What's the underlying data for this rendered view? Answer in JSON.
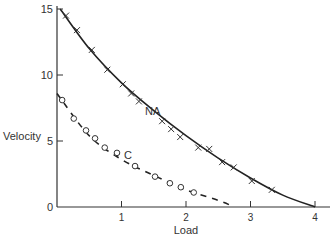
{
  "chart_data": {
    "type": "line",
    "title": "",
    "xlabel": "Load",
    "ylabel": "Velocity",
    "xlim": [
      0,
      4.3
    ],
    "ylim": [
      0,
      15.5
    ],
    "xticks": [
      1,
      2,
      3,
      4
    ],
    "yticks": [
      0,
      5,
      10,
      15
    ],
    "grid": false,
    "legend": "inline labels",
    "series": [
      {
        "name": "NA",
        "marker": "x",
        "curve": [
          [
            0.05,
            15.0
          ],
          [
            0.5,
            12.0
          ],
          [
            1.0,
            9.4
          ],
          [
            1.5,
            7.3
          ],
          [
            2.0,
            5.4
          ],
          [
            2.5,
            3.7
          ],
          [
            3.0,
            2.2
          ],
          [
            3.5,
            0.9
          ],
          [
            4.0,
            0.0
          ]
        ],
        "points": [
          [
            0.14,
            14.5
          ],
          [
            0.31,
            13.4
          ],
          [
            0.54,
            11.9
          ],
          [
            0.78,
            10.4
          ],
          [
            1.02,
            9.3
          ],
          [
            1.15,
            8.6
          ],
          [
            1.27,
            8.0
          ],
          [
            1.63,
            6.5
          ],
          [
            1.77,
            5.9
          ],
          [
            1.91,
            5.3
          ],
          [
            2.19,
            4.5
          ],
          [
            2.36,
            4.4
          ],
          [
            2.56,
            3.4
          ],
          [
            2.74,
            3.0
          ],
          [
            3.02,
            1.97
          ],
          [
            3.33,
            1.3
          ]
        ]
      },
      {
        "name": "C",
        "marker": "o",
        "curve": [
          [
            0.0,
            8.6
          ],
          [
            0.5,
            5.4
          ],
          [
            1.0,
            3.6
          ],
          [
            1.5,
            2.4
          ],
          [
            2.0,
            1.3
          ],
          [
            2.5,
            0.5
          ],
          [
            2.75,
            0.0
          ]
        ],
        "points": [
          [
            0.08,
            8.1
          ],
          [
            0.26,
            6.7
          ],
          [
            0.45,
            5.8
          ],
          [
            0.59,
            5.2
          ],
          [
            0.74,
            4.5
          ],
          [
            0.93,
            4.1
          ],
          [
            1.21,
            3.1
          ],
          [
            1.52,
            2.3
          ],
          [
            1.75,
            1.8
          ],
          [
            1.92,
            1.5
          ],
          [
            2.12,
            1.1
          ]
        ]
      }
    ],
    "annotations": [
      {
        "text": "NA",
        "x": 1.35,
        "y": 7.3
      },
      {
        "text": "C",
        "x": 1.08,
        "y": 4.0
      }
    ]
  },
  "axes": {
    "xlabel": "Load",
    "ylabel": "Velocity",
    "xtick_labels": [
      "1",
      "2",
      "3",
      "4"
    ],
    "ytick_labels": [
      "0",
      "5",
      "10",
      "15"
    ]
  },
  "labels": {
    "na": "NA",
    "c": "C"
  }
}
